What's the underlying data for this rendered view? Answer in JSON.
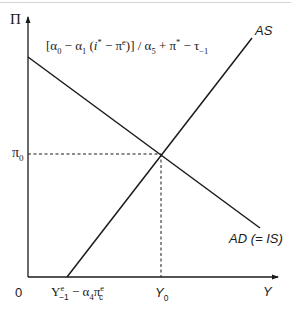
{
  "diagram": {
    "type": "AD-AS equilibrium diagram",
    "y_axis_label": "Π",
    "x_axis_label": "Y",
    "origin_label": "0",
    "intercept_formula": {
      "open": "[α",
      "a0_sub": "0",
      "minus1": " − α",
      "a1_sub": "1",
      "paren_open": " (",
      "i": "i",
      "i_sup": "*",
      "minus2": " − π",
      "pe_sup": "e",
      "close": ")] / α",
      "a5_sub": "5",
      "plus": " + π",
      "pistar_sup": "*",
      "minus3": " − τ",
      "tau_sub": "−1"
    },
    "intercept_formula_text": "[α0 − α1 (i* − πe)] / α5 + π* − τ−1",
    "pi0_label": {
      "base": "π",
      "sub": "0"
    },
    "y0_label": {
      "base": "Y",
      "sub": "0"
    },
    "as_x_intercept_label": {
      "Y": "Y",
      "Y_sup": "e",
      "Y_sub": "−1",
      "minus": " − α",
      "a4_sub": "4",
      "pi": "π",
      "pi_sup": "e",
      "pi_sub": "c"
    },
    "as_x_intercept_text": "Ye−1 − α4πec",
    "curves": [
      {
        "name": "AS",
        "label": "AS",
        "slope": "upward"
      },
      {
        "name": "AD",
        "label": "AD (= IS)",
        "slope": "downward"
      }
    ],
    "equilibrium": {
      "x_label": "Y0",
      "y_label": "π0"
    }
  }
}
